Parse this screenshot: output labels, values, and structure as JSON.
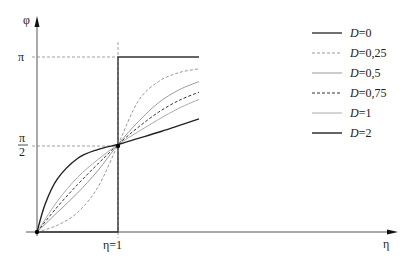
{
  "chart_data": {
    "type": "line",
    "title": "",
    "xlabel": "η",
    "ylabel": "φ",
    "x_ticks": [
      {
        "label": "η=1",
        "value": 1
      }
    ],
    "y_ticks": [
      {
        "label": "π/2",
        "value": 1.5708
      },
      {
        "label": "π",
        "value": 3.1416
      }
    ],
    "xlim": [
      0,
      2.0
    ],
    "ylim": [
      0,
      3.1416
    ],
    "grid": false,
    "legend_position": "right",
    "reference_lines": [
      {
        "type": "vertical",
        "x": 1,
        "style": "dashed"
      },
      {
        "type": "horizontal",
        "y": 3.1416,
        "style": "dashed"
      },
      {
        "type": "horizontal",
        "y": 1.5708,
        "style": "dashed"
      }
    ],
    "series": [
      {
        "name": "D=0",
        "style": "solid",
        "color": "#333333",
        "x": [
          0,
          1,
          1,
          2.0
        ],
        "y": [
          0,
          0,
          3.1416,
          3.1416
        ]
      },
      {
        "name": "D=0,25",
        "style": "dashed",
        "color": "#999999",
        "x": [
          0,
          0.25,
          0.5,
          0.75,
          1,
          1.25,
          1.5,
          1.75,
          2.0
        ],
        "y": [
          0.0,
          0.12,
          0.35,
          0.8,
          1.5708,
          2.35,
          2.7,
          2.86,
          2.93
        ]
      },
      {
        "name": "D=0,5",
        "style": "solid",
        "color": "#999999",
        "x": [
          0,
          0.25,
          0.5,
          0.75,
          1,
          1.25,
          1.5,
          1.75,
          2.0
        ],
        "y": [
          0.0,
          0.35,
          0.7,
          1.1,
          1.5708,
          1.98,
          2.32,
          2.55,
          2.7
        ]
      },
      {
        "name": "D=0,75",
        "style": "dashed",
        "color": "#333333",
        "x": [
          0,
          0.25,
          0.5,
          0.75,
          1,
          1.25,
          1.5,
          1.75,
          2.0
        ],
        "y": [
          0.0,
          0.45,
          0.85,
          1.22,
          1.5708,
          1.88,
          2.15,
          2.36,
          2.51
        ]
      },
      {
        "name": "D=1",
        "style": "solid",
        "color": "#aaaaaa",
        "x": [
          0,
          0.25,
          0.5,
          0.75,
          1,
          1.25,
          1.5,
          1.75,
          2.0
        ],
        "y": [
          0.0,
          0.55,
          0.98,
          1.3,
          1.5708,
          1.8,
          2.02,
          2.22,
          2.38
        ]
      },
      {
        "name": "D=2",
        "style": "solid",
        "color": "#222222",
        "x": [
          0,
          0.1,
          0.25,
          0.5,
          0.75,
          1,
          1.25,
          1.5,
          1.75,
          2.0
        ],
        "y": [
          0.0,
          0.5,
          0.95,
          1.32,
          1.48,
          1.5708,
          1.68,
          1.79,
          1.91,
          2.03
        ]
      }
    ]
  },
  "legend": [
    {
      "label": "D",
      "value": "0"
    },
    {
      "label": "D",
      "value": "0,25"
    },
    {
      "label": "D",
      "value": "0,5"
    },
    {
      "label": "D",
      "value": "0,75"
    },
    {
      "label": "D",
      "value": "1"
    },
    {
      "label": "D",
      "value": "2"
    }
  ],
  "axis_labels": {
    "x": "η",
    "y": "φ",
    "pi": "π",
    "half_num": "π",
    "half_den": "2",
    "eta1": "η=1"
  }
}
